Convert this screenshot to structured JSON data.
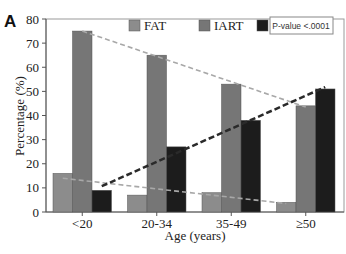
{
  "chart_data": {
    "type": "bar",
    "panel_label": "A",
    "title": "",
    "xlabel": "Age (years)",
    "ylabel": "Percentage (%)",
    "ylim": [
      0,
      80
    ],
    "yticks": [
      0,
      10,
      20,
      30,
      40,
      50,
      60,
      70,
      80
    ],
    "grid": false,
    "legend_position": "top",
    "categories": [
      "<20",
      "20-34",
      "35-49",
      "≥50"
    ],
    "series": [
      {
        "name": "FAT",
        "color": "#8c8c8c",
        "values": [
          16,
          7,
          8,
          4
        ]
      },
      {
        "name": "IART",
        "color": "#767676",
        "values": [
          75,
          65,
          53,
          44
        ]
      },
      {
        "name": "AF",
        "color": "#1c1c1c",
        "values": [
          9,
          27,
          38,
          51
        ]
      }
    ],
    "trend_lines": [
      {
        "series": "FAT",
        "style": "dashed",
        "color": "#a8a8a8"
      },
      {
        "series": "IART",
        "style": "dashed",
        "color": "#a8a8a8"
      },
      {
        "series": "AF",
        "style": "dashed",
        "color": "#2a2a2a"
      }
    ],
    "annotation": "P-value <.0001"
  }
}
